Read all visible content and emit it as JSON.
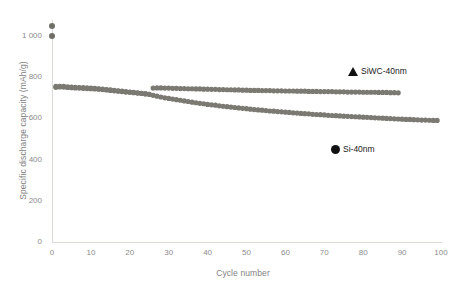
{
  "chart_data": {
    "type": "scatter",
    "title": "",
    "subtitle": "",
    "xlabel": "Cycle number",
    "ylabel": "Specific discharge capacity (mAh/g)",
    "xlim": [
      0,
      100
    ],
    "ylim": [
      0,
      1100
    ],
    "xticks": [
      0,
      10,
      20,
      30,
      40,
      50,
      60,
      70,
      80,
      90,
      100
    ],
    "xtick_labels": [
      "0",
      "10",
      "20",
      "30",
      "40",
      "50",
      "60",
      "70",
      "80",
      "90",
      "100"
    ],
    "yticks": [
      0,
      200,
      400,
      600,
      800,
      1000
    ],
    "ytick_labels": [
      "0",
      "200",
      "400",
      "600",
      "800",
      "1 000"
    ],
    "grid": false,
    "legend_position": "inside-right",
    "marker_color": "#7a7a72",
    "legend_marker_color": "#111111",
    "axis_color": "#d9d9d6",
    "tick_label_color": "#8c8c8c",
    "axis_title_color": "#7f7f7f",
    "series": [
      {
        "name": "SiWC-40nm",
        "marker": "triangle",
        "x": [
          0,
          1,
          2,
          3,
          4,
          5,
          6,
          7,
          8,
          9,
          10,
          11,
          12,
          13,
          14,
          15,
          16,
          17,
          18,
          19,
          20,
          21,
          22,
          23,
          24,
          25,
          26,
          27,
          28,
          29,
          30,
          31,
          32,
          33,
          34,
          35,
          36,
          37,
          38,
          39,
          40,
          41,
          42,
          43,
          44,
          45,
          46,
          47,
          48,
          49,
          50,
          51,
          52,
          53,
          54,
          55,
          56,
          57,
          58,
          59,
          60,
          61,
          62,
          63,
          64,
          65,
          66,
          67,
          68,
          69,
          70,
          71,
          72,
          73,
          74,
          75,
          76,
          77,
          78,
          79,
          80,
          81,
          82,
          83,
          84,
          85,
          86,
          87,
          88,
          89
        ],
        "y": [
          1000,
          751,
          753,
          752,
          750,
          749,
          748,
          747,
          746,
          745,
          744,
          743,
          742,
          740,
          738,
          736,
          734,
          732,
          730,
          728,
          727,
          725,
          723,
          721,
          719,
          717,
          747,
          748,
          748,
          747,
          747,
          746,
          746,
          745,
          745,
          744,
          744,
          743,
          743,
          742,
          742,
          741,
          741,
          740,
          740,
          739,
          739,
          738,
          738,
          737,
          737,
          736,
          736,
          736,
          735,
          735,
          735,
          734,
          734,
          734,
          733,
          733,
          733,
          732,
          732,
          732,
          731,
          731,
          731,
          730,
          730,
          730,
          730,
          729,
          729,
          729,
          728,
          728,
          728,
          728,
          727,
          727,
          727,
          727,
          726,
          726,
          726,
          725,
          725,
          724
        ]
      },
      {
        "name": "Si-40nm",
        "marker": "circle",
        "x": [
          0,
          1,
          2,
          3,
          4,
          5,
          6,
          7,
          8,
          9,
          10,
          11,
          12,
          13,
          14,
          15,
          16,
          17,
          18,
          19,
          20,
          21,
          22,
          23,
          24,
          25,
          26,
          27,
          28,
          29,
          30,
          31,
          32,
          33,
          34,
          35,
          36,
          37,
          38,
          39,
          40,
          41,
          42,
          43,
          44,
          45,
          46,
          47,
          48,
          49,
          50,
          51,
          52,
          53,
          54,
          55,
          56,
          57,
          58,
          59,
          60,
          61,
          62,
          63,
          64,
          65,
          66,
          67,
          68,
          69,
          70,
          71,
          72,
          73,
          74,
          75,
          76,
          77,
          78,
          79,
          80,
          81,
          82,
          83,
          84,
          85,
          86,
          87,
          88,
          89,
          90,
          91,
          92,
          93,
          94,
          95,
          96,
          97,
          98,
          99
        ],
        "y": [
          1048,
          755,
          756,
          755,
          753,
          752,
          751,
          750,
          749,
          748,
          747,
          746,
          744,
          742,
          740,
          738,
          736,
          734,
          732,
          730,
          728,
          726,
          724,
          722,
          720,
          717,
          712,
          708,
          704,
          700,
          697,
          694,
          691,
          688,
          685,
          682,
          679,
          676,
          673,
          671,
          668,
          666,
          664,
          661,
          659,
          657,
          655,
          653,
          651,
          649,
          647,
          645,
          643,
          641,
          640,
          638,
          636,
          635,
          633,
          632,
          630,
          629,
          627,
          626,
          624,
          623,
          622,
          620,
          619,
          618,
          617,
          615,
          614,
          613,
          612,
          611,
          610,
          609,
          608,
          607,
          606,
          605,
          604,
          603,
          602,
          601,
          600,
          599,
          598,
          597,
          596,
          595,
          595,
          594,
          593,
          592,
          592,
          591,
          590,
          590
        ]
      }
    ]
  },
  "legend": {
    "entries": [
      {
        "label": "SiWC-40nm",
        "marker": "triangle"
      },
      {
        "label": "Si-40nm",
        "marker": "circle"
      }
    ]
  },
  "axes": {
    "y_title": "Specific discharge capacity (mAh/g)",
    "x_title": "Cycle number"
  }
}
